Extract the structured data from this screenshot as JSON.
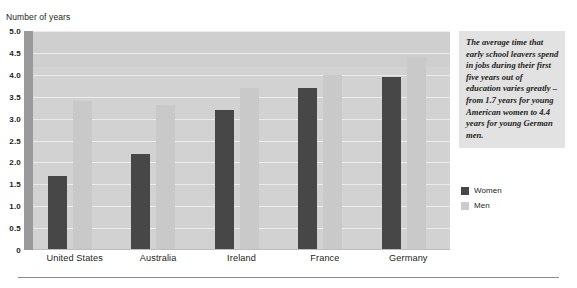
{
  "chart_data": {
    "type": "bar",
    "title": "",
    "xlabel": "",
    "ylabel": "Number of years",
    "ylim": [
      0,
      5.0
    ],
    "yticks": [
      "5.0",
      "4.5",
      "4.0",
      "3.5",
      "3.0",
      "2.5",
      "2.0",
      "1.5",
      "1.0",
      "0.5",
      "0"
    ],
    "ytick_values": [
      5.0,
      4.5,
      4.0,
      3.5,
      3.0,
      2.5,
      2.0,
      1.5,
      1.0,
      0.5,
      0
    ],
    "grid": true,
    "legend_position": "right",
    "categories": [
      "United States",
      "Australia",
      "Ireland",
      "France",
      "Germany"
    ],
    "series": [
      {
        "name": "Women",
        "color": "#474747",
        "values": [
          1.7,
          2.2,
          3.2,
          3.7,
          3.95
        ]
      },
      {
        "name": "Men",
        "color": "#c9c9c9",
        "values": [
          3.4,
          3.3,
          3.7,
          4.0,
          4.4
        ]
      }
    ]
  },
  "axis_title": "Number of years",
  "caption": {
    "text": "The average time that early school leavers spend in jobs during their first five years out of education varies greatly – from 1.7 years for young American women to 4.4 years for young German men."
  },
  "legend": {
    "items": [
      {
        "label": "Women",
        "color": "#474747"
      },
      {
        "label": "Men",
        "color": "#cccccc"
      }
    ]
  },
  "colors": {
    "plot_background": "#d2d2d2",
    "gridline": "#eceaea",
    "axis": "#9a9a9a",
    "women": "#474747",
    "men": "#c9c9c9",
    "caption_background": "#e2e2e2",
    "text": "#231f20"
  }
}
